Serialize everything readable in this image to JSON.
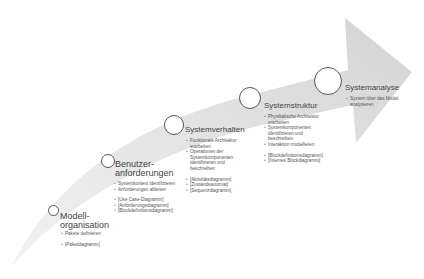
{
  "diagram": {
    "type": "curved-process-arrow",
    "colors": {
      "arrow_fill": "#d9d9d9",
      "arrow_fill_light": "#ececec",
      "circle_border": "#555555",
      "text": "#444444"
    },
    "stages": [
      {
        "title_lines": [
          "Modell-",
          "organisation"
        ],
        "tasks": [
          "Pakete definieren"
        ],
        "diagrams": [
          "[Paketdiagramm]"
        ]
      },
      {
        "title_lines": [
          "Benutzer-",
          "anforderungen"
        ],
        "tasks": [
          "Systemkontext identifizieren",
          "Anforderungen ableiten"
        ],
        "diagrams": [
          "[Use Case-Diagramm]",
          "[Anforderungsdiagramm]",
          "[Blockdefinitionsdiagramm]"
        ]
      },
      {
        "title_lines": [
          "Systemverhalten"
        ],
        "tasks": [
          "Funktionale Architektur",
          "erarbeiten",
          "Operationen der",
          "Systemkomponenten",
          "identifizieren und",
          "beschreiben"
        ],
        "diagrams": [
          "[Aktivitätsdiagramm]",
          "[Zustandsautomat]",
          "[Sequenzdiagramm]"
        ]
      },
      {
        "title_lines": [
          "Systemstruktur"
        ],
        "tasks": [
          "Physikalische Architektur",
          "erarbeiten",
          "Systemkomponenten",
          "identifizieren und",
          "beschreiben",
          "Interaktion modellieren"
        ],
        "diagrams": [
          "[Blockdefinitionsdiagramm]",
          "[Internes Blockdiagramm]"
        ]
      },
      {
        "title_lines": [
          "Systemanalyse"
        ],
        "tasks": [
          "System über das Model",
          "analysieren"
        ],
        "diagrams": []
      }
    ]
  }
}
